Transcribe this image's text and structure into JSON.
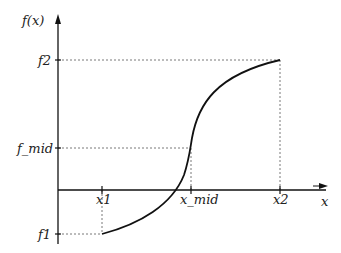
{
  "diagram": {
    "axes": {
      "y_label": "f(x)",
      "x_label": "x"
    },
    "y_ticks": [
      {
        "label": "f2",
        "y": 60
      },
      {
        "label": "f_mid",
        "y": 148
      },
      {
        "label": "f1",
        "y": 234
      }
    ],
    "x_ticks": [
      {
        "label": "x1",
        "x": 102
      },
      {
        "label": "x_mid",
        "x": 191
      },
      {
        "label": "x2",
        "x": 280
      }
    ],
    "curve": {
      "description": "monotonically increasing S-shaped function from (x1,f1) through (x_mid,f_mid) to (x2,f2)",
      "color": "#111111"
    },
    "guide_line_color": "#555555"
  }
}
